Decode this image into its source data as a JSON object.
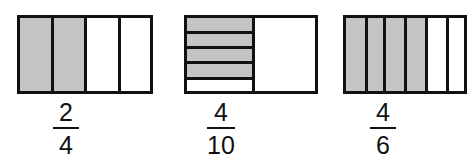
{
  "colors": {
    "shaded": "#c4c4c4",
    "unshaded": "#ffffff",
    "outline": "#111111"
  },
  "figures": [
    {
      "id": "figure-1",
      "orientation": "vertical-strips",
      "parts": 4,
      "shaded_parts": 2,
      "fraction": {
        "numerator": "2",
        "denominator": "4"
      }
    },
    {
      "id": "figure-2",
      "orientation": "left-half-horizontal-strips",
      "parts_left_half": 5,
      "shaded_parts": 4,
      "right_half": "unshaded",
      "fraction": {
        "numerator": "4",
        "denominator": "10"
      }
    },
    {
      "id": "figure-3",
      "orientation": "vertical-strips",
      "parts": 6,
      "shaded_parts": 4,
      "fraction": {
        "numerator": "4",
        "denominator": "6"
      }
    }
  ]
}
